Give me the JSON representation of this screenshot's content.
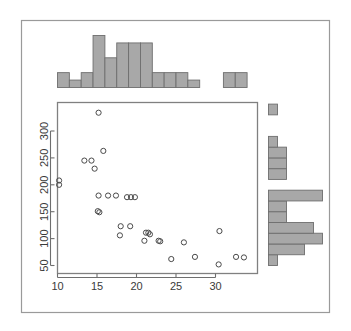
{
  "figure": {
    "type": "scatterplot-with-marginal-histograms",
    "background_color": "#ffffff",
    "frame_color": "#9a9a9a",
    "axis_color": "#6e6e6e",
    "bar_fill_color": "#a8a8a8",
    "bar_stroke_color": "#6e6e6e",
    "point_stroke_color": "#4a4a4a",
    "point_fill_color": "none"
  },
  "chart_data": {
    "type": "scatter",
    "title": "",
    "subtitle": "",
    "xlabel": "",
    "ylabel": "",
    "xlim": [
      9.0,
      34.5
    ],
    "ylim": [
      40,
      345
    ],
    "grid": false,
    "legend": null,
    "xticks": [
      10,
      15,
      20,
      25,
      30
    ],
    "yticks": [
      50,
      100,
      150,
      200,
      250,
      300
    ],
    "xtick_labels": [
      "10",
      "15",
      "20",
      "25",
      "30"
    ],
    "ytick_labels": [
      "50",
      "100",
      "150",
      "200",
      "250",
      "300"
    ],
    "points": [
      {
        "x": 15.2,
        "y": 334
      },
      {
        "x": 15.8,
        "y": 263
      },
      {
        "x": 13.4,
        "y": 245
      },
      {
        "x": 14.3,
        "y": 245
      },
      {
        "x": 14.7,
        "y": 230
      },
      {
        "x": 10.2,
        "y": 208
      },
      {
        "x": 10.2,
        "y": 200
      },
      {
        "x": 15.2,
        "y": 180
      },
      {
        "x": 16.4,
        "y": 180
      },
      {
        "x": 17.4,
        "y": 180
      },
      {
        "x": 18.8,
        "y": 177
      },
      {
        "x": 19.3,
        "y": 177
      },
      {
        "x": 19.8,
        "y": 177
      },
      {
        "x": 15.1,
        "y": 151
      },
      {
        "x": 15.3,
        "y": 149
      },
      {
        "x": 18.0,
        "y": 123
      },
      {
        "x": 19.2,
        "y": 123
      },
      {
        "x": 17.9,
        "y": 106
      },
      {
        "x": 21.2,
        "y": 111
      },
      {
        "x": 21.5,
        "y": 111
      },
      {
        "x": 21.7,
        "y": 108
      },
      {
        "x": 21.0,
        "y": 96
      },
      {
        "x": 22.8,
        "y": 96
      },
      {
        "x": 23.0,
        "y": 95
      },
      {
        "x": 26.0,
        "y": 93
      },
      {
        "x": 30.5,
        "y": 114
      },
      {
        "x": 24.4,
        "y": 62
      },
      {
        "x": 27.4,
        "y": 66
      },
      {
        "x": 30.4,
        "y": 52
      },
      {
        "x": 32.6,
        "y": 66
      },
      {
        "x": 33.6,
        "y": 65
      }
    ],
    "top_histogram": {
      "orientation": "vertical",
      "bin_edges": [
        10.0,
        11.5,
        13.0,
        14.5,
        16.0,
        17.5,
        19.0,
        20.5,
        22.0,
        23.5,
        25.0,
        26.5,
        28.0,
        29.5,
        31.0,
        32.5,
        34.0
      ],
      "counts": [
        2,
        1,
        2,
        7,
        4,
        6,
        6,
        6,
        2,
        2,
        2,
        1,
        0,
        0,
        2,
        2
      ],
      "max_count": 7
    },
    "right_histogram": {
      "orientation": "horizontal",
      "bin_edges": [
        50,
        70,
        90,
        110,
        130,
        150,
        170,
        190,
        210,
        230,
        250,
        270,
        290,
        310,
        330,
        350
      ],
      "counts": [
        1,
        4,
        6,
        5,
        2,
        2,
        6,
        0,
        2,
        2,
        2,
        1,
        0,
        0,
        1
      ],
      "max_count": 6
    }
  }
}
